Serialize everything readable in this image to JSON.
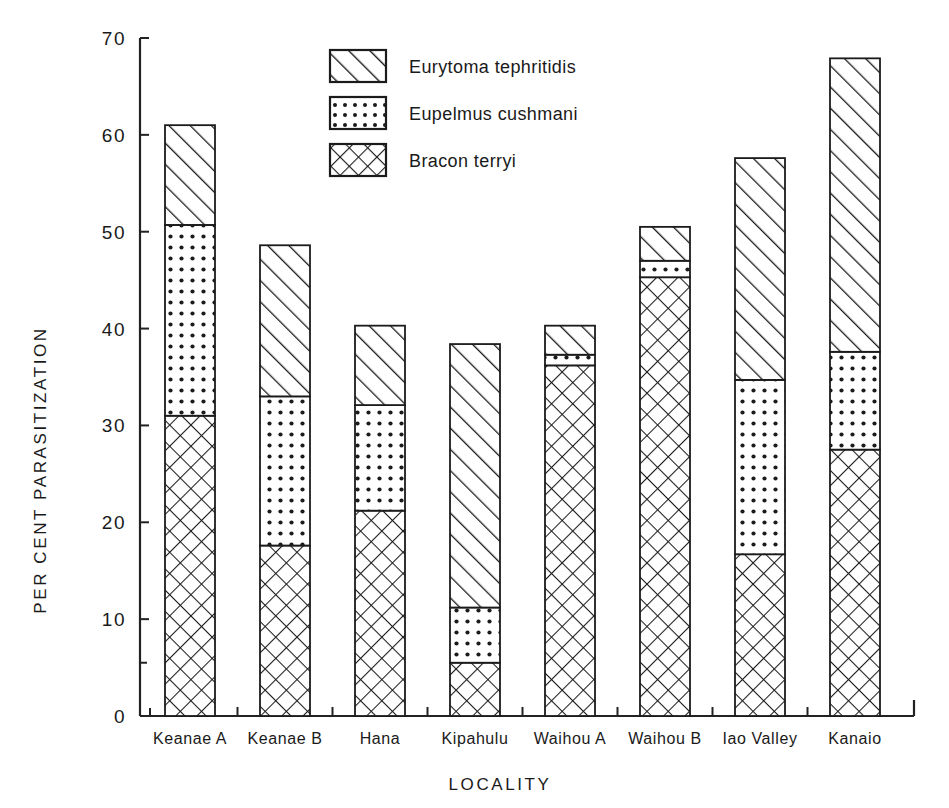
{
  "chart_data": {
    "type": "bar",
    "subtype": "stacked-bar",
    "title": "",
    "xlabel": "LOCALITY",
    "ylabel": "PER CENT PARASITIZATION",
    "ylim": [
      0,
      70
    ],
    "yticks": [
      0,
      10,
      20,
      30,
      40,
      50,
      60,
      70
    ],
    "ytick_labels": [
      "0",
      "10",
      "20",
      "30",
      "40",
      "50",
      "60",
      "70"
    ],
    "grid": false,
    "legend_position": "top-center",
    "categories": [
      "Keanae A",
      "Keanae B",
      "Hana",
      "Kipahulu",
      "Waihou A",
      "Waihou B",
      "Iao Valley",
      "Kanaio"
    ],
    "series": [
      {
        "name": "Bracon terryi",
        "pattern": "crosshatch",
        "values": [
          31.0,
          17.6,
          21.2,
          5.5,
          36.2,
          45.3,
          16.7,
          27.5
        ]
      },
      {
        "name": "Eupelmus cushmani",
        "pattern": "dots",
        "values": [
          19.7,
          15.4,
          10.9,
          5.7,
          1.1,
          1.7,
          18.0,
          10.1
        ]
      },
      {
        "name": "Eurytoma tephritidis",
        "pattern": "diagonal",
        "values": [
          10.3,
          15.6,
          8.2,
          27.2,
          3.0,
          3.5,
          22.9,
          30.3
        ]
      }
    ],
    "stack_tops": {
      "Bracon terryi": [
        31.0,
        17.6,
        21.2,
        5.5,
        36.2,
        45.3,
        16.7,
        27.5
      ],
      "Eupelmus cushmani": [
        50.7,
        33.0,
        32.1,
        11.2,
        37.3,
        47.0,
        34.7,
        37.6
      ],
      "Eurytoma tephritidis": [
        61.0,
        48.6,
        40.3,
        38.4,
        40.3,
        50.5,
        57.6,
        67.9
      ]
    },
    "totals": [
      61.0,
      48.6,
      40.3,
      38.4,
      40.3,
      50.5,
      57.6,
      67.9
    ]
  },
  "legend": {
    "entries": [
      {
        "label": "Eurytoma tephritidis",
        "pattern": "diagonal"
      },
      {
        "label": "Eupelmus cushmani",
        "pattern": "dots"
      },
      {
        "label": "Bracon terryi",
        "pattern": "crosshatch"
      }
    ]
  },
  "colors": {
    "ink": "#1a1a1a",
    "fill": "#ffffff",
    "background": "#ffffff"
  }
}
